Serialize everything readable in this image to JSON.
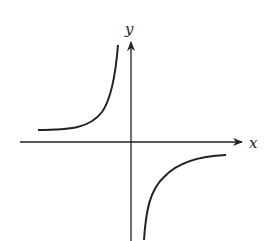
{
  "diagram": {
    "type": "function-graph",
    "axes": {
      "x_label": "x",
      "y_label": "y"
    },
    "curves": [
      {
        "name": "upper-left-branch",
        "quadrant": "II"
      },
      {
        "name": "lower-right-branch",
        "quadrant": "IV"
      }
    ],
    "colors": {
      "stroke": "#222222",
      "background": "#ffffff"
    }
  }
}
